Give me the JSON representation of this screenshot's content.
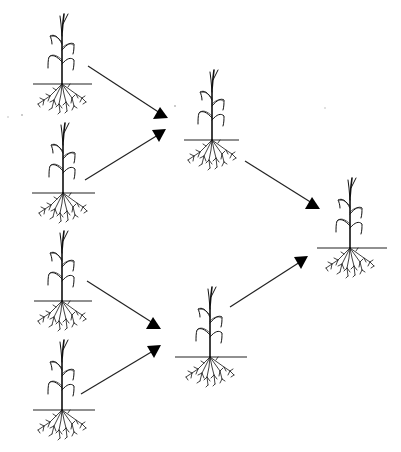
{
  "diagram": {
    "colors": {
      "background": "#ffffff",
      "ink": "#111111"
    },
    "nodes": [
      {
        "id": "parent-1",
        "generation": 0,
        "cx": 62,
        "ground_y": 84,
        "ground_x1": 33,
        "ground_x2": 92
      },
      {
        "id": "parent-2",
        "generation": 0,
        "cx": 63,
        "ground_y": 193,
        "ground_x1": 32,
        "ground_x2": 95
      },
      {
        "id": "parent-3",
        "generation": 0,
        "cx": 62,
        "ground_y": 301,
        "ground_x1": 34,
        "ground_x2": 92
      },
      {
        "id": "parent-4",
        "generation": 0,
        "cx": 62,
        "ground_y": 410,
        "ground_x1": 33,
        "ground_x2": 95
      },
      {
        "id": "hybrid-1",
        "generation": 1,
        "cx": 212,
        "ground_y": 140,
        "ground_x1": 184,
        "ground_x2": 239
      },
      {
        "id": "hybrid-2",
        "generation": 1,
        "cx": 210,
        "ground_y": 357,
        "ground_x1": 175,
        "ground_x2": 247
      },
      {
        "id": "final",
        "generation": 2,
        "cx": 350,
        "ground_y": 248,
        "ground_x1": 317,
        "ground_x2": 387
      }
    ],
    "edges": [
      {
        "from": "parent-1",
        "to": "hybrid-1",
        "x1": 88,
        "y1": 66,
        "x2": 168,
        "y2": 118
      },
      {
        "from": "parent-2",
        "to": "hybrid-1",
        "x1": 85,
        "y1": 180,
        "x2": 166,
        "y2": 130
      },
      {
        "from": "parent-3",
        "to": "hybrid-2",
        "x1": 87,
        "y1": 281,
        "x2": 161,
        "y2": 328
      },
      {
        "from": "parent-4",
        "to": "hybrid-2",
        "x1": 81,
        "y1": 394,
        "x2": 160,
        "y2": 346
      },
      {
        "from": "hybrid-1",
        "to": "final",
        "x1": 245,
        "y1": 161,
        "x2": 320,
        "y2": 208
      },
      {
        "from": "hybrid-2",
        "to": "final",
        "x1": 230,
        "y1": 307,
        "x2": 308,
        "y2": 257
      }
    ]
  }
}
